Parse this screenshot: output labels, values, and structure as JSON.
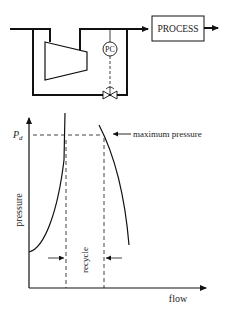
{
  "schematic": {
    "process_label": "PROCESS",
    "controller_label": "PC",
    "components": [
      "compressor",
      "pressure-controller",
      "recycle-valve",
      "process-block"
    ]
  },
  "plot": {
    "y_axis_label": "pressure",
    "x_axis_label": "flow",
    "pd_label": "P",
    "pd_subscript": "d",
    "annotation": "maximum pressure",
    "region_label": "recycle"
  },
  "colors": {
    "line": "#111111",
    "background": "#ffffff"
  }
}
